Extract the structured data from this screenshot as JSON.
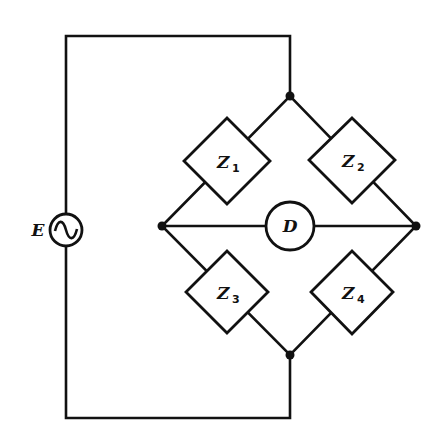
{
  "diagram": {
    "title": "",
    "type": "AC impedance bridge circuit",
    "source": {
      "label": "E",
      "symbol": "~"
    },
    "detector": {
      "label": "D"
    },
    "impedances": [
      {
        "label": "Z",
        "subscript": "1"
      },
      {
        "label": "Z",
        "subscript": "2"
      },
      {
        "label": "Z",
        "subscript": "3"
      },
      {
        "label": "Z",
        "subscript": "4"
      }
    ],
    "colors": {
      "line": "#111111",
      "background": "#ffffff"
    }
  }
}
